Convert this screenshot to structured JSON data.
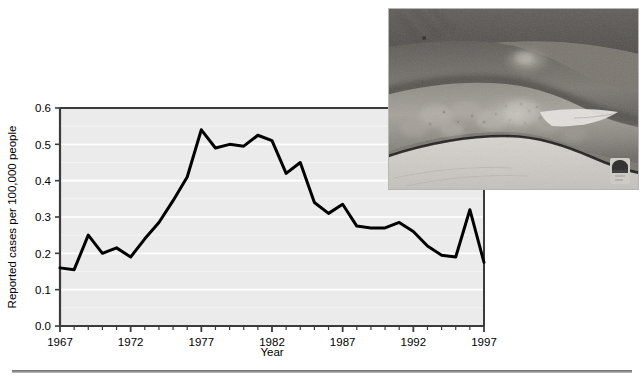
{
  "figure": {
    "background_color": "#ffffff",
    "bottom_rule_color": "#808080"
  },
  "chart_data": {
    "type": "line",
    "title": "",
    "xlabel": "Year",
    "ylabel": "Reported cases per 100,000 people",
    "xlim": [
      1967,
      1997
    ],
    "ylim": [
      0.0,
      0.6
    ],
    "grid": true,
    "grid_color": "#ffffff",
    "plot_background": "#ebebeb",
    "line_color": "#000000",
    "line_width": 3,
    "legend": "none",
    "x_tick_labels": [
      "1967",
      "1972",
      "1977",
      "1982",
      "1987",
      "1992",
      "1997"
    ],
    "x_major_ticks": [
      1967,
      1972,
      1977,
      1982,
      1987,
      1992,
      1997
    ],
    "x_minor_tick_interval": 1,
    "y_tick_labels": [
      "0.0",
      "0.1",
      "0.2",
      "0.3",
      "0.4",
      "0.5",
      "0.6"
    ],
    "y_ticks": [
      0.0,
      0.1,
      0.2,
      0.3,
      0.4,
      0.5,
      0.6
    ],
    "x": [
      1967,
      1968,
      1969,
      1970,
      1971,
      1972,
      1973,
      1974,
      1975,
      1976,
      1977,
      1978,
      1979,
      1980,
      1981,
      1982,
      1983,
      1984,
      1985,
      1986,
      1987,
      1988,
      1989,
      1990,
      1991,
      1992,
      1993,
      1994,
      1995,
      1996,
      1997
    ],
    "values": [
      0.16,
      0.155,
      0.25,
      0.2,
      0.215,
      0.19,
      0.24,
      0.285,
      0.345,
      0.41,
      0.54,
      0.49,
      0.5,
      0.495,
      0.525,
      0.51,
      0.42,
      0.45,
      0.34,
      0.31,
      0.335,
      0.275,
      0.27,
      0.27,
      0.285,
      0.26,
      0.22,
      0.195,
      0.19,
      0.32,
      0.175
    ],
    "series_name": "Reported cases per 100,000 people"
  },
  "inset": {
    "caption": "",
    "alt": "grayscale photograph of legs with rash",
    "border_color": "#b8b6b2"
  }
}
